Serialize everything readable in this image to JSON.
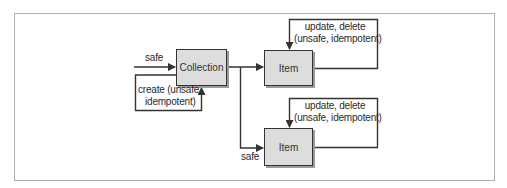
{
  "diagram": {
    "nodes": {
      "collection": {
        "label": "Collection"
      },
      "item_top": {
        "label": "Item"
      },
      "item_bottom": {
        "label": "Item"
      }
    },
    "edges": {
      "into_collection": {
        "label": "safe"
      },
      "create_loop": {
        "line1": "create (unsafe,",
        "line2": "idempotent)"
      },
      "item_top_loop": {
        "line1": "update, delete",
        "line2": "(unsafe, idempotent)"
      },
      "item_bottom_loop": {
        "line1": "update, delete",
        "line2": "(unsafe, idempotent)"
      },
      "to_item_bottom": {
        "label": "safe"
      }
    },
    "colors": {
      "frame": "#b0b0b0",
      "line": "#333333",
      "node_fill": "#dddddd",
      "node_shadow": "#9a9a9a"
    }
  }
}
